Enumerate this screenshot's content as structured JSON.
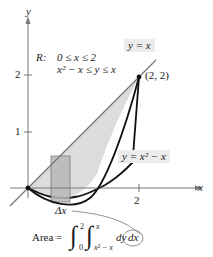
{
  "axes": {
    "x_label": "x",
    "y_label": "y",
    "x_ticks": [
      "2"
    ],
    "y_ticks": [
      "1",
      "2"
    ]
  },
  "region": {
    "name": "R:",
    "line1": "0 ≤ x ≤ 2",
    "line2": "x² − x ≤ y ≤ x"
  },
  "curves": {
    "upper": "y = x",
    "lower": "y = x² − x"
  },
  "point": "(2, 2)",
  "strip_label": "Δx",
  "formula": {
    "prefix": "Area =",
    "outer_upper": "2",
    "outer_lower": "0",
    "inner_upper": "x",
    "inner_lower": "x² − x",
    "dy": "dy",
    "dx": "dx"
  },
  "colors": {
    "fill": "#d9d9d9",
    "strip": "#b3b3b3",
    "label_box": "#ececec"
  }
}
